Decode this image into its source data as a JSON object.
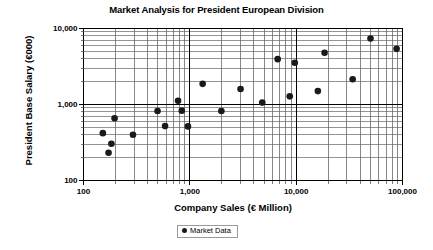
{
  "chart_data": {
    "type": "scatter",
    "title": "Market Analysis for President European Division",
    "xlabel": "Company Sales (€ Million)",
    "ylabel": "President Base Salary (€000)",
    "xscale": "log",
    "yscale": "log",
    "xlim": [
      100,
      100000
    ],
    "ylim": [
      100,
      10000
    ],
    "xticks": [
      100,
      1000,
      10000,
      100000
    ],
    "xtick_labels": [
      "100",
      "1,000",
      "10,000",
      "100,000"
    ],
    "yticks": [
      100,
      1000,
      10000
    ],
    "ytick_labels": [
      "100",
      "1,000",
      "10,000"
    ],
    "grid": true,
    "grid_minor": true,
    "legend_position": "bottom",
    "series": [
      {
        "name": "Market Data",
        "marker": "circle",
        "color": "#1a1a1a",
        "points": [
          {
            "x": 152,
            "y": 420
          },
          {
            "x": 172,
            "y": 232
          },
          {
            "x": 183,
            "y": 305
          },
          {
            "x": 196,
            "y": 660
          },
          {
            "x": 292,
            "y": 400
          },
          {
            "x": 497,
            "y": 820
          },
          {
            "x": 585,
            "y": 520
          },
          {
            "x": 775,
            "y": 1120
          },
          {
            "x": 840,
            "y": 830
          },
          {
            "x": 960,
            "y": 515
          },
          {
            "x": 1320,
            "y": 1870
          },
          {
            "x": 1980,
            "y": 820
          },
          {
            "x": 3000,
            "y": 1600
          },
          {
            "x": 4800,
            "y": 1060
          },
          {
            "x": 6700,
            "y": 3950
          },
          {
            "x": 8700,
            "y": 1280
          },
          {
            "x": 9700,
            "y": 3550
          },
          {
            "x": 16000,
            "y": 1500
          },
          {
            "x": 18500,
            "y": 4800
          },
          {
            "x": 34000,
            "y": 2150
          },
          {
            "x": 50000,
            "y": 7400
          },
          {
            "x": 88000,
            "y": 5400
          }
        ]
      }
    ]
  },
  "legend": {
    "label": "Market Data"
  }
}
